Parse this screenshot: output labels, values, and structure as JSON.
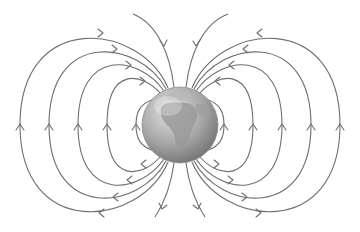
{
  "diagram": {
    "background": "#ffffff",
    "line_color": "#6e6e6e",
    "globe": {
      "center": [
        180,
        125
      ],
      "radius": 38,
      "color_light": "#d8d8d8",
      "color_dark": "#7a7a7a",
      "continents": [
        "Africa",
        "Europe",
        "Arabia"
      ]
    },
    "field_lines": {
      "left_loop_crossings_x": [
        20,
        49,
        78,
        107,
        136
      ],
      "right_loop_crossings_x": [
        224,
        253,
        282,
        311,
        340
      ],
      "open_lines": [
        "top-left",
        "top-right",
        "bottom-left",
        "bottom-right"
      ],
      "direction": "arrows point from south pole (bottom) upward around the sides into north pole (top)"
    }
  }
}
